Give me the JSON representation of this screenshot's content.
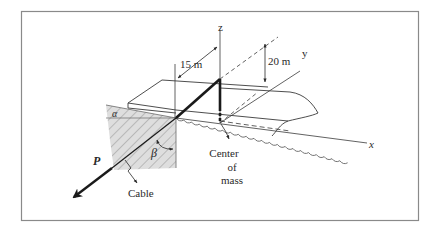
{
  "figure": {
    "labels": {
      "z_axis": "z",
      "y_axis": "y",
      "x_axis": "x",
      "dim_15": "15 m",
      "dim_20": "20 m",
      "force": "P",
      "angle_alpha": "α",
      "angle_beta": "β",
      "cable": "Cable",
      "com_line1": "Center",
      "com_line2": "of",
      "com_line3": "mass"
    },
    "colors": {
      "frame": "#8a8a8a",
      "line": "#3a3a3a",
      "hatch_fill": "#dcdcdc",
      "cable": "#1a1a1a"
    }
  }
}
